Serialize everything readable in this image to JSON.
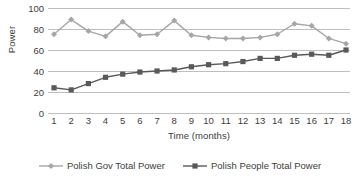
{
  "chart_data": {
    "type": "line",
    "title": "",
    "xlabel": "Time (months)",
    "ylabel": "Power",
    "x": [
      1,
      2,
      3,
      4,
      5,
      6,
      7,
      8,
      9,
      10,
      11,
      12,
      13,
      14,
      15,
      16,
      17,
      18
    ],
    "xtick_labels": [
      "1",
      "2",
      "3",
      "4",
      "5",
      "6",
      "7",
      "8",
      "9",
      "10",
      "11",
      "12",
      "13",
      "14",
      "15",
      "16",
      "17",
      "18"
    ],
    "ytick_labels": [
      "0",
      "20",
      "40",
      "60",
      "80",
      "100"
    ],
    "yticks": [
      0,
      20,
      40,
      60,
      80,
      100
    ],
    "ylim": [
      0,
      100
    ],
    "xlim": [
      1,
      18
    ],
    "grid": "horizontal",
    "legend_position": "bottom-center",
    "series": [
      {
        "name": "Polish Gov Total Power",
        "color": "#a6a6a6",
        "marker": "diamond",
        "values": [
          75,
          89,
          78,
          73,
          87,
          74,
          75,
          88,
          74,
          72,
          71,
          71,
          72,
          75,
          85,
          83,
          71,
          66
        ]
      },
      {
        "name": "Polish People Total Power",
        "color": "#595959",
        "marker": "square",
        "values": [
          24,
          22,
          28,
          34,
          37,
          39,
          40,
          41,
          44,
          46,
          47,
          49,
          52,
          52,
          55,
          56,
          55,
          60
        ]
      }
    ]
  },
  "legend": {
    "items": [
      {
        "label": "Polish Gov Total Power"
      },
      {
        "label": "Polish People Total Power"
      }
    ]
  },
  "axes": {
    "y_title": "Power",
    "x_title": "Time (months)"
  },
  "colors": {
    "gov_series": "#a6a6a6",
    "people_series": "#595959",
    "gridline": "#bfbfbf",
    "text": "#3d3d3d",
    "background": "#ffffff"
  }
}
